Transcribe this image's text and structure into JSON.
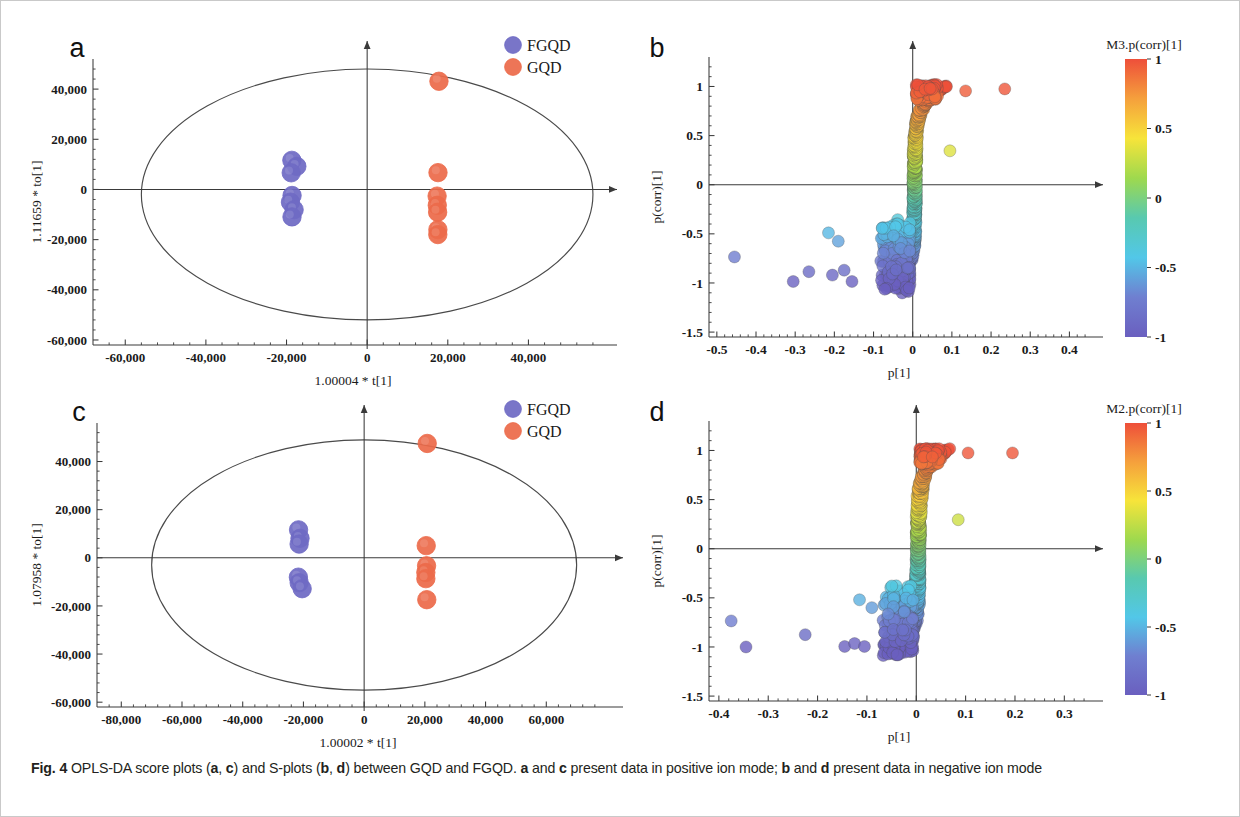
{
  "figure": {
    "label": "Fig. 4",
    "caption_text": " OPLS-DA score plots (a, c) and S-plots (b, d) between GQD and FGQD. a and c present data in positive ion mode; b and d present data in negative ion mode",
    "caption_full": "Fig. 4 OPLS-DA score plots (a, c) and S-plots (b, d) between GQD and FGQD. a and c present data in positive ion mode; b and d present data in negative ion mode"
  },
  "colors": {
    "fgqd": "#6f6bc4",
    "gqd": "#ec6b4a",
    "axis": "#3a3a3a",
    "ellipse": "#4a4a4a",
    "text": "#1a1a1a"
  },
  "legend": {
    "items": [
      {
        "label": "FGQD",
        "color": "#6f6bc4"
      },
      {
        "label": "GQD",
        "color": "#ec6b4a"
      }
    ]
  },
  "chart_data": [
    {
      "panel": "a",
      "type": "scatter",
      "title": "OPLS-DA score plot (positive ion mode)",
      "xlabel": "1.00004 * t[1]",
      "ylabel": "1.11659 * to[1]",
      "xlim": [
        -68000,
        58000
      ],
      "ylim": [
        -62000,
        52000
      ],
      "xticks": [
        "-60,000",
        "-40,000",
        "-20,000",
        "0",
        "20,000",
        "40,000"
      ],
      "xtickvals": [
        -60000,
        -40000,
        -20000,
        0,
        20000,
        40000
      ],
      "yticks": [
        "40,000",
        "20,000",
        "0",
        "-20,000",
        "-40,000",
        "-60,000"
      ],
      "ytickvals": [
        40000,
        20000,
        0,
        -20000,
        -40000,
        -60000
      ],
      "grid": false,
      "legend_position": "top-right",
      "ellipse": {
        "cx": 0,
        "cy": -2000,
        "rx": 56000,
        "ry": 50000
      },
      "series": [
        {
          "name": "FGQD",
          "color": "#6f6bc4",
          "points": [
            [
              -18600,
              11500
            ],
            [
              -17400,
              9000
            ],
            [
              -18900,
              6800
            ],
            [
              -18500,
              -2300
            ],
            [
              -18900,
              -5200
            ],
            [
              -18200,
              -8200
            ],
            [
              -18600,
              -11000
            ]
          ]
        },
        {
          "name": "GQD",
          "color": "#ec6b4a",
          "points": [
            [
              17800,
              43200
            ],
            [
              17600,
              6700
            ],
            [
              17300,
              -2700
            ],
            [
              17500,
              -6200
            ],
            [
              17400,
              -9300
            ],
            [
              17600,
              -16200
            ],
            [
              17500,
              -18200
            ]
          ]
        }
      ]
    },
    {
      "panel": "b",
      "type": "scatter",
      "title": "S-plot (negative ion mode)",
      "xlabel": "p[1]",
      "ylabel": "p(corr)[1]",
      "xlim": [
        -0.52,
        0.45
      ],
      "ylim": [
        -1.55,
        1.3
      ],
      "xticks": [
        "-0.5",
        "-0.4",
        "-0.3",
        "-0.2",
        "-0.1",
        "0",
        "0.1",
        "0.2",
        "0.3",
        "0.4"
      ],
      "xtickvals": [
        -0.5,
        -0.4,
        -0.3,
        -0.2,
        -0.1,
        0,
        0.1,
        0.2,
        0.3,
        0.4
      ],
      "yticks": [
        "1",
        "0.5",
        "0",
        "-0.5",
        "-1",
        "-1.5"
      ],
      "ytickvals": [
        1,
        0.5,
        0,
        -0.5,
        -1,
        -1.5
      ],
      "grid": false,
      "colorbar": {
        "title": "M3.p(corr)[1]",
        "ticks": [
          "1",
          "0.5",
          "0",
          "-0.5",
          "-1"
        ],
        "tickvals": [
          1,
          0.5,
          0,
          -0.5,
          -1
        ],
        "colormap": [
          "#ee4f3a",
          "#f5a03c",
          "#f7e43a",
          "#9ed94e",
          "#58c9b0",
          "#52c7e8",
          "#6f7fd0",
          "#6a5fbf"
        ]
      },
      "outliers": [
        [
          0.135,
          0.955
        ],
        [
          0.235,
          0.975
        ],
        [
          0.095,
          0.345
        ],
        [
          -0.455,
          -0.735
        ],
        [
          -0.305,
          -0.985
        ],
        [
          -0.265,
          -0.885
        ],
        [
          -0.205,
          -0.92
        ],
        [
          -0.175,
          -0.87
        ],
        [
          -0.155,
          -0.985
        ],
        [
          -0.215,
          -0.49
        ],
        [
          -0.19,
          -0.575
        ]
      ],
      "band_x_center": 0.005,
      "n_points_approx": 700
    },
    {
      "panel": "c",
      "type": "scatter",
      "title": "OPLS-DA score plot (positive ion mode)",
      "xlabel": "1.00002 * t[1]",
      "ylabel": "1.07958 * to[1]",
      "xlim": [
        -88000,
        80000
      ],
      "ylim": [
        -62000,
        56000
      ],
      "xticks": [
        "-80,000",
        "-60,000",
        "-40,000",
        "-20,000",
        "0",
        "20,000",
        "40,000",
        "60,000"
      ],
      "xtickvals": [
        -80000,
        -60000,
        -40000,
        -20000,
        0,
        20000,
        40000,
        60000
      ],
      "yticks": [
        "40,000",
        "20,000",
        "0",
        "-20,000",
        "-40,000",
        "-60,000"
      ],
      "ytickvals": [
        40000,
        20000,
        0,
        -20000,
        -40000,
        -60000
      ],
      "grid": false,
      "legend_position": "top-right",
      "ellipse": {
        "cx": 0,
        "cy": -3000,
        "rx": 70000,
        "ry": 52000
      },
      "series": [
        {
          "name": "FGQD",
          "color": "#6f6bc4",
          "points": [
            [
              -21500,
              11800
            ],
            [
              -21200,
              8200
            ],
            [
              -21500,
              5600
            ],
            [
              -21800,
              -8200
            ],
            [
              -21300,
              -10500
            ],
            [
              -20600,
              -12800
            ]
          ]
        },
        {
          "name": "GQD",
          "color": "#ec6b4a",
          "points": [
            [
              20600,
              47500
            ],
            [
              20400,
              4800
            ],
            [
              20700,
              -3200
            ],
            [
              20500,
              -6200
            ],
            [
              20300,
              -8500
            ],
            [
              20500,
              -17500
            ]
          ]
        }
      ]
    },
    {
      "panel": "d",
      "type": "scatter",
      "title": "S-plot (negative ion mode)",
      "xlabel": "p[1]",
      "ylabel": "p(corr)[1]",
      "xlim": [
        -0.42,
        0.35
      ],
      "ylim": [
        -1.55,
        1.3
      ],
      "xticks": [
        "-0.4",
        "-0.3",
        "-0.2",
        "-0.1",
        "0",
        "0.1",
        "0.2",
        "0.3"
      ],
      "xtickvals": [
        -0.4,
        -0.3,
        -0.2,
        -0.1,
        0,
        0.1,
        0.2,
        0.3
      ],
      "yticks": [
        "1",
        "0.5",
        "0",
        "-0.5",
        "-1",
        "-1.5"
      ],
      "ytickvals": [
        1,
        0.5,
        0,
        -0.5,
        -1,
        -1.5
      ],
      "grid": false,
      "colorbar": {
        "title": "M2.p(corr)[1]",
        "ticks": [
          "1",
          "0.5",
          "0",
          "-0.5",
          "-1"
        ],
        "tickvals": [
          1,
          0.5,
          0,
          -0.5,
          -1
        ],
        "colormap": [
          "#ee4f3a",
          "#f5a03c",
          "#f7e43a",
          "#9ed94e",
          "#58c9b0",
          "#52c7e8",
          "#6f7fd0",
          "#6a5fbf"
        ]
      },
      "outliers": [
        [
          0.105,
          0.975
        ],
        [
          0.195,
          0.975
        ],
        [
          0.085,
          0.295
        ],
        [
          -0.375,
          -0.735
        ],
        [
          -0.345,
          -1.0
        ],
        [
          -0.225,
          -0.875
        ],
        [
          -0.145,
          -0.995
        ],
        [
          -0.125,
          -0.965
        ],
        [
          -0.105,
          -0.995
        ],
        [
          -0.115,
          -0.52
        ],
        [
          -0.09,
          -0.6
        ]
      ],
      "band_x_center": 0.004,
      "n_points_approx": 700
    }
  ]
}
